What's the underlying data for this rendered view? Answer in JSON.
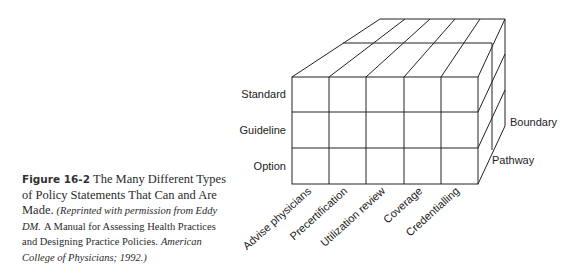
{
  "figure": {
    "number": "Figure 16-2",
    "title": "The Many Different Types of Policy Statements That Can and Are Made.",
    "credit_prefix": "(Reprinted with permission from Eddy DM.",
    "credit_book": "A Manual for Assessing Health Practices and Designing Practice Policies.",
    "credit_suffix": "American College of Physicians; 1992.)"
  },
  "diagram": {
    "row_labels": [
      "Standard",
      "Guideline",
      "Option"
    ],
    "column_labels": [
      "Advise physicians",
      "Precertification",
      "Utilization review",
      "Coverage",
      "Credentialling"
    ],
    "depth_labels": [
      "Boundary",
      "Pathway"
    ]
  }
}
